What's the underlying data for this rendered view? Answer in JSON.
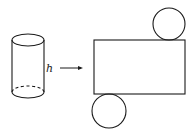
{
  "diagram": {
    "cylinder": {
      "height_label": "h",
      "top_ellipse": {
        "cx": 28,
        "cy": 40,
        "rx": 16,
        "ry": 6
      },
      "bottom_ellipse": {
        "cx": 28,
        "cy": 92,
        "rx": 16,
        "ry": 6
      }
    },
    "arrow": {
      "x1": 60,
      "y1": 68,
      "x2": 83,
      "y2": 68
    },
    "net": {
      "rectangle": {
        "x": 94,
        "y": 40,
        "width": 91,
        "height": 54
      },
      "top_circle": {
        "cx": 169,
        "cy": 24,
        "r": 16
      },
      "bottom_circle": {
        "cx": 109,
        "cy": 111,
        "r": 17
      }
    },
    "stroke_color": "#1a1a1a"
  }
}
